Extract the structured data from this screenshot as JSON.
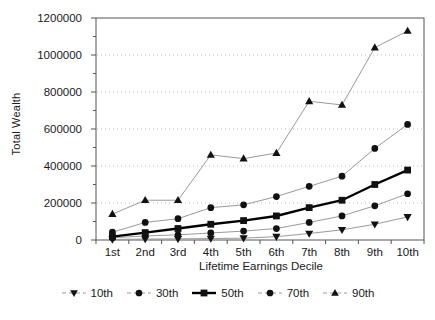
{
  "chart_data": {
    "type": "line",
    "title": "",
    "xlabel": "Lifetime Earnings Decile",
    "ylabel": "Total Wealth",
    "categories": [
      "1st",
      "2nd",
      "3rd",
      "4th",
      "5th",
      "6th",
      "7th",
      "8th",
      "9th",
      "10th"
    ],
    "ylim": [
      0,
      1200000
    ],
    "ytick_labels": [
      "0",
      "200000",
      "400000",
      "600000",
      "800000",
      "1000000",
      "1200000"
    ],
    "ytick_values": [
      0,
      200000,
      400000,
      600000,
      800000,
      1000000,
      1200000
    ],
    "minor_tick_step": 100000,
    "grid": "horizontal-dotted-at-major-ticks",
    "legend_position": "bottom",
    "series": [
      {
        "name": "10th",
        "marker": "triangle-down",
        "values": [
          3000,
          5000,
          6000,
          8000,
          10000,
          18000,
          35000,
          55000,
          85000,
          125000
        ]
      },
      {
        "name": "30th",
        "marker": "circle",
        "values": [
          12000,
          22000,
          28000,
          38000,
          48000,
          62000,
          95000,
          130000,
          185000,
          250000
        ]
      },
      {
        "name": "50th",
        "marker": "square",
        "values": [
          18000,
          40000,
          62000,
          85000,
          105000,
          130000,
          175000,
          215000,
          300000,
          378000
        ]
      },
      {
        "name": "70th",
        "marker": "circle",
        "values": [
          42000,
          95000,
          115000,
          175000,
          190000,
          235000,
          290000,
          345000,
          495000,
          625000
        ]
      },
      {
        "name": "90th",
        "marker": "triangle-up",
        "values": [
          140000,
          215000,
          215000,
          460000,
          440000,
          470000,
          750000,
          730000,
          1040000,
          1130000
        ]
      }
    ],
    "colors": {
      "series_line": "#9a9a9a",
      "series_median_line": "#000000",
      "marker": "#111111",
      "axis": "#555555",
      "grid": "#bfbfbf",
      "background": "#ffffff"
    }
  }
}
